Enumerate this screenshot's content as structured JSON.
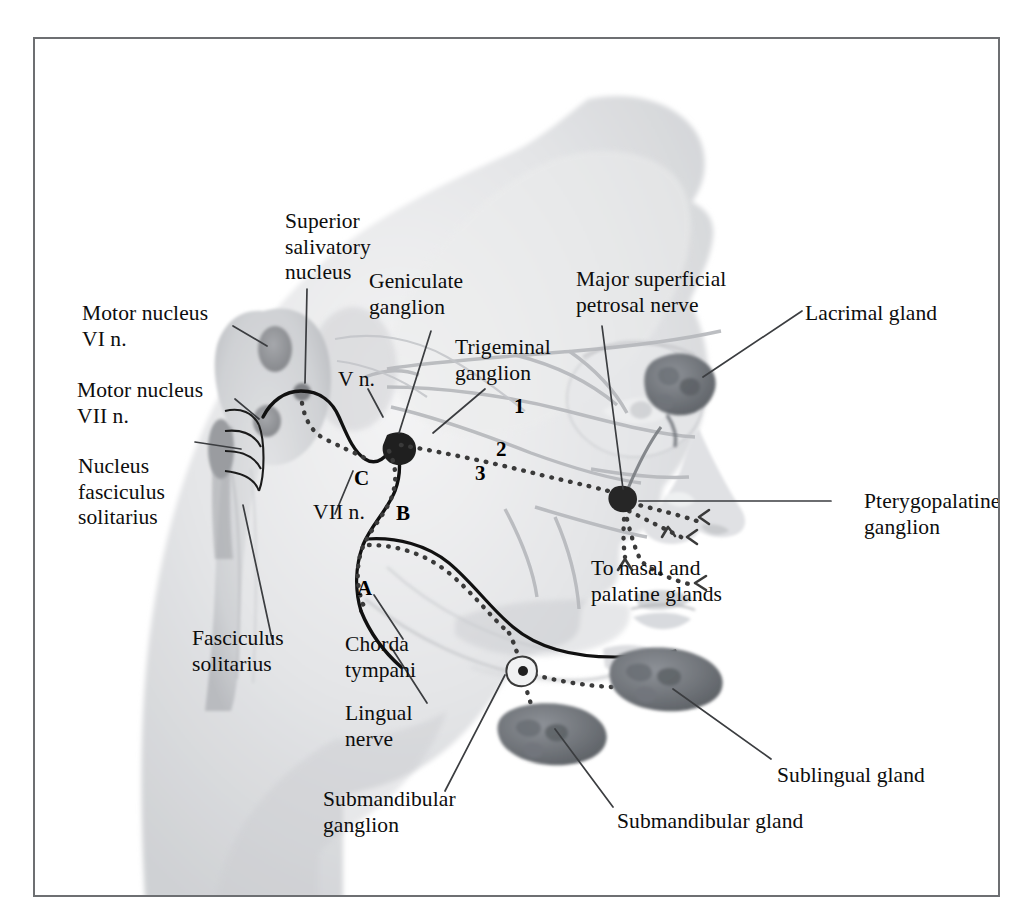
{
  "figure": {
    "domain": "anatomical-diagram",
    "title_visible": false,
    "border_color": "#6d6f72",
    "background": "#ffffff"
  },
  "labels": [
    {
      "id": "superior-salivatory-nucleus",
      "text": "Superior\nsalivatory\nnucleus",
      "x": 250,
      "y": 170,
      "align": "left"
    },
    {
      "id": "motor-nucleus-vi",
      "text": "Motor nucleus\nVI n.",
      "x": 47,
      "y": 262,
      "align": "left"
    },
    {
      "id": "geniculate-ganglion",
      "text": "Geniculate\nganglion",
      "x": 334,
      "y": 230,
      "align": "left"
    },
    {
      "id": "major-superficial-petrosal-nerve",
      "text": "Major superficial\npetrosal nerve",
      "x": 541,
      "y": 228,
      "align": "left"
    },
    {
      "id": "lacrimal-gland",
      "text": "Lacrimal gland",
      "x": 770,
      "y": 262,
      "align": "left"
    },
    {
      "id": "motor-nucleus-vii",
      "text": "Motor nucleus\nVII n.",
      "x": 42,
      "y": 339,
      "align": "left"
    },
    {
      "id": "v-n",
      "text": "V n.",
      "x": 303,
      "y": 328,
      "align": "left"
    },
    {
      "id": "trigeminal-ganglion",
      "text": "Trigeminal\nganglion",
      "x": 420,
      "y": 296,
      "align": "left"
    },
    {
      "id": "nucleus-fasciculus-solitarius",
      "text": "Nucleus\nfasciculus\nsolitarius",
      "x": 43,
      "y": 415,
      "align": "left"
    },
    {
      "id": "vii-n",
      "text": "VII n.",
      "x": 278,
      "y": 461,
      "align": "left"
    },
    {
      "id": "pterygopalatine-ganglion",
      "text": "Pterygopalatine\nganglion",
      "x": 829,
      "y": 450,
      "align": "left"
    },
    {
      "id": "to-nasal-and-palatine-glands",
      "text": "To nasal and\npalatine glands",
      "x": 556,
      "y": 517,
      "align": "left"
    },
    {
      "id": "fasciculus-solitarius",
      "text": "Fasciculus\nsolitarius",
      "x": 157,
      "y": 587,
      "align": "left"
    },
    {
      "id": "chorda-tympani",
      "text": "Chorda\ntympani",
      "x": 310,
      "y": 593,
      "align": "left"
    },
    {
      "id": "lingual-nerve",
      "text": "Lingual\nnerve",
      "x": 310,
      "y": 662,
      "align": "left"
    },
    {
      "id": "submandibular-ganglion",
      "text": "Submandibular\nganglion",
      "x": 288,
      "y": 748,
      "align": "left"
    },
    {
      "id": "submandibular-gland",
      "text": "Submandibular gland",
      "x": 582,
      "y": 770,
      "align": "left"
    },
    {
      "id": "sublingual-gland",
      "text": "Sublingual gland",
      "x": 742,
      "y": 724,
      "align": "left"
    }
  ],
  "markers": [
    {
      "id": "marker-1",
      "text": "1",
      "x": 479,
      "y": 355,
      "note": "ophthalmic division of trigeminal nerve"
    },
    {
      "id": "marker-2",
      "text": "2",
      "x": 461,
      "y": 398,
      "note": "maxillary division of trigeminal nerve"
    },
    {
      "id": "marker-3",
      "text": "3",
      "x": 440,
      "y": 422,
      "note": "mandibular division of trigeminal nerve"
    },
    {
      "id": "marker-a",
      "text": "A",
      "x": 322,
      "y": 537,
      "note": "facial nerve segment A"
    },
    {
      "id": "marker-b",
      "text": "B",
      "x": 361,
      "y": 462,
      "note": "facial nerve segment B"
    },
    {
      "id": "marker-c",
      "text": "C",
      "x": 319,
      "y": 427,
      "note": "facial nerve segment C"
    }
  ],
  "structures": [
    {
      "id": "brainstem",
      "kind": "silhouette",
      "tone": "#d8d9db"
    },
    {
      "id": "head-profile",
      "kind": "silhouette",
      "tone": "#dcdde0"
    },
    {
      "id": "motor-nucleus-vi-blob",
      "kind": "nucleus",
      "tone": "#9a9ca0"
    },
    {
      "id": "motor-nucleus-vii-blob",
      "kind": "nucleus",
      "tone": "#9a9ca0"
    },
    {
      "id": "superior-salivatory-nucleus-blob",
      "kind": "nucleus",
      "tone": "#8e9094"
    },
    {
      "id": "nucleus-solitarius-blob",
      "kind": "nucleus",
      "tone": "#97999d"
    },
    {
      "id": "geniculate-ganglion-blob",
      "kind": "ganglion",
      "tone": "#2b2b2b"
    },
    {
      "id": "pterygopalatine-ganglion-blob",
      "kind": "ganglion",
      "tone": "#3a3a3a"
    },
    {
      "id": "submandibular-ganglion-blob",
      "kind": "ganglion",
      "tone": "#3a3a3a"
    },
    {
      "id": "lacrimal-gland-blob",
      "kind": "gland",
      "tone": "#767a80"
    },
    {
      "id": "submandibular-gland-blob",
      "kind": "gland",
      "tone": "#7b7f85"
    },
    {
      "id": "sublingual-gland-blob",
      "kind": "gland",
      "tone": "#7b7f85"
    },
    {
      "id": "facial-nerve-trunk",
      "kind": "nerve-solid",
      "tone": "#111111"
    },
    {
      "id": "lingual-nerve-trunk",
      "kind": "nerve-solid",
      "tone": "#111111"
    },
    {
      "id": "parasympathetic-fibers",
      "kind": "nerve-dotted",
      "tone": "#3f3f3f"
    },
    {
      "id": "trigeminal-branches",
      "kind": "nerve-faint",
      "tone": "#b9bbbe"
    }
  ]
}
